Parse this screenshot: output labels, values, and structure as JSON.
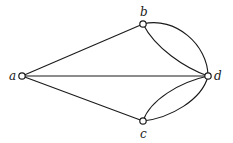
{
  "graph": {
    "title": "",
    "nodes": [
      {
        "id": "a",
        "label": "a",
        "x": 22,
        "y": 76,
        "lx": 9,
        "ly": 80
      },
      {
        "id": "b",
        "label": "b",
        "x": 143,
        "y": 24,
        "lx": 140,
        "ly": 16
      },
      {
        "id": "c",
        "label": "c",
        "x": 143,
        "y": 121,
        "lx": 140,
        "ly": 137
      },
      {
        "id": "d",
        "label": "d",
        "x": 208,
        "y": 76,
        "lx": 214,
        "ly": 80
      }
    ],
    "edges": [
      {
        "from": "a",
        "to": "b",
        "type": "straight"
      },
      {
        "from": "a",
        "to": "c",
        "type": "straight"
      },
      {
        "from": "a",
        "to": "d",
        "type": "straight"
      },
      {
        "from": "b",
        "to": "d",
        "type": "curve-outer"
      },
      {
        "from": "b",
        "to": "d",
        "type": "curve-inner"
      },
      {
        "from": "c",
        "to": "d",
        "type": "curve-outer"
      },
      {
        "from": "c",
        "to": "d",
        "type": "curve-inner"
      }
    ],
    "colors": {
      "stroke": "#1a1a1a",
      "node_fill": "#ffffff",
      "background": "#ffffff"
    }
  }
}
